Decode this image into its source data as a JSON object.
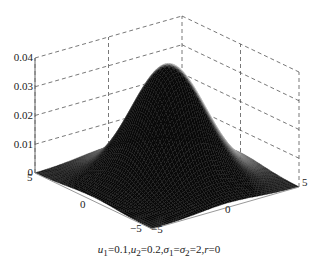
{
  "chart_data": {
    "type": "surface3d",
    "title": "",
    "function": "bivariate normal density",
    "parameters": {
      "u1": 0.1,
      "u2": 0.2,
      "sigma1": 2,
      "sigma2": 2,
      "r": 0
    },
    "xlabel": "",
    "ylabel": "",
    "zlabel": "",
    "xlim": [
      -5,
      5
    ],
    "ylim": [
      -5,
      5
    ],
    "zlim": [
      0,
      0.04
    ],
    "x_ticks": [
      "-5",
      "0",
      "5"
    ],
    "y_ticks": [
      "-5",
      "0",
      "5"
    ],
    "z_ticks": [
      "0",
      "0.01",
      "0.02",
      "0.03",
      "0.04"
    ],
    "peak_value": 0.0398,
    "grid": true,
    "legend": null
  },
  "axes": {
    "z_ticks": [
      {
        "label": "0.04",
        "y": 58
      },
      {
        "label": "0.03",
        "y": 87
      },
      {
        "label": "0.02",
        "y": 116
      },
      {
        "label": "0.01",
        "y": 145
      },
      {
        "label": "0",
        "y": 173
      }
    ],
    "left_axis_ticks": [
      {
        "label": "5",
        "x": 27,
        "y": 178
      },
      {
        "label": "0",
        "x": 80,
        "y": 205
      },
      {
        "label": "−5",
        "x": 130,
        "y": 229
      }
    ],
    "right_axis_ticks": [
      {
        "label": "−5",
        "x": 151,
        "y": 230
      },
      {
        "label": "0",
        "x": 225,
        "y": 210
      },
      {
        "label": "5",
        "x": 302,
        "y": 183
      }
    ]
  },
  "caption": {
    "u1": "u",
    "u1_sub": "1",
    "u1_val": "=0.1,",
    "u2": "u",
    "u2_sub": "2",
    "u2_val": "=0.2,",
    "s1": "σ",
    "s1_sub": "1",
    "eq": "=",
    "s2": "σ",
    "s2_sub": "2",
    "s2_val": "=2,",
    "r": "r",
    "r_val": "=0"
  }
}
